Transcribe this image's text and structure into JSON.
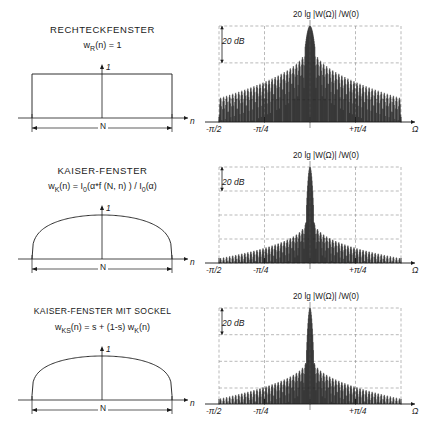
{
  "figure": {
    "background": "#ffffff",
    "ink": "#1a1a1a",
    "grid_color": "#777777"
  },
  "panels": [
    {
      "id": "rechteckfenster",
      "title": "Rechteckfenster",
      "formula_main": "w",
      "formula_sub": "R",
      "formula_rest": "(n)  =  1",
      "time_plot": {
        "y_axis_label": "1",
        "x_axis_label": "n",
        "width_label": "N",
        "shape": "rectangular"
      },
      "spectrum": {
        "label": "20  lg  |W(Ω)| /W(0)",
        "scale_marker": "20 dB",
        "x_axis_label": "Ω",
        "ticks": [
          "-π/2",
          "-π/4",
          "+π/4"
        ],
        "sidelobe_peak_db": -13,
        "sidelobe_decay": "slow",
        "mainlobe_halfwidth": 0.055,
        "floor_db": -52
      }
    },
    {
      "id": "kaiser-fenster",
      "title": "Kaiser-Fenster",
      "formula_main": "w",
      "formula_sub": "K",
      "formula_rest": "(n)  =  I",
      "formula_rest2": "(α*f (N, n) )   /  I",
      "formula_rest3": "(α)",
      "formula_zero": "0",
      "time_plot": {
        "y_axis_label": "1",
        "x_axis_label": "n",
        "width_label": "N",
        "shape": "kaiser"
      },
      "spectrum": {
        "label": "20  lg  |W(Ω)| /W(0)",
        "scale_marker": "20 dB",
        "x_axis_label": "Ω",
        "ticks": [
          "-π/2",
          "-π/4",
          "+π/4"
        ],
        "sidelobe_peak_db": -42,
        "sidelobe_decay": "fast",
        "mainlobe_halfwidth": 0.042,
        "floor_db": -80
      }
    },
    {
      "id": "kaiser-fenster-mit-sockel",
      "title": "Kaiser-Fenster mit Sockel",
      "formula_main": "w",
      "formula_sub": "KS",
      "formula_rest": "(n)  =  s  +   (1-s) w",
      "formula_sub2": "K",
      "formula_rest2": "(n)",
      "time_plot": {
        "y_axis_label": "1",
        "x_axis_label": "n",
        "width_label": "N",
        "shape": "kaiser-pedestal"
      },
      "spectrum": {
        "label": "20  lg  |W(Ω)| /W(0)",
        "scale_marker": "20 dB",
        "x_axis_label": "Ω",
        "ticks": [
          "-π/2",
          "-π/4",
          "+π/4"
        ],
        "sidelobe_peak_db": -38,
        "sidelobe_decay": "medium",
        "mainlobe_halfwidth": 0.04,
        "floor_db": -72
      }
    }
  ],
  "chart_data": {
    "type": "line",
    "charts": [
      {
        "name": "Rechteckfenster - Zeitbereich",
        "type": "line",
        "xlabel": "n",
        "ylabel": "1",
        "x": [
          0,
          0,
          1,
          1
        ],
        "y": [
          0,
          1,
          1,
          0
        ],
        "annotation": "N"
      },
      {
        "name": "Rechteckfenster - Spektrum",
        "type": "line",
        "xlabel": "Ω",
        "ylabel": "20 lg |W(Ω)|/W(0)",
        "xticks": [
          "-π/2",
          "-π/4",
          "0",
          "+π/4"
        ],
        "ygrid_step_db": 20,
        "mainlobe_db": 0,
        "first_sidelobe_db": -13,
        "sidelobe_floor_db": -52
      },
      {
        "name": "Kaiser-Fenster - Zeitbereich",
        "type": "line",
        "xlabel": "n",
        "ylabel": "1",
        "annotation": "N"
      },
      {
        "name": "Kaiser-Fenster - Spektrum",
        "type": "line",
        "xlabel": "Ω",
        "ylabel": "20 lg |W(Ω)|/W(0)",
        "xticks": [
          "-π/2",
          "-π/4",
          "0",
          "+π/4"
        ],
        "ygrid_step_db": 20,
        "mainlobe_db": 0,
        "first_sidelobe_db": -42,
        "sidelobe_floor_db": -80
      },
      {
        "name": "Kaiser-Fenster mit Sockel - Zeitbereich",
        "type": "line",
        "xlabel": "n",
        "ylabel": "1",
        "annotation": "N"
      },
      {
        "name": "Kaiser-Fenster mit Sockel - Spektrum",
        "type": "line",
        "xlabel": "Ω",
        "ylabel": "20 lg |W(Ω)|/W(0)",
        "xticks": [
          "-π/2",
          "-π/4",
          "0",
          "+π/4"
        ],
        "ygrid_step_db": 20,
        "mainlobe_db": 0,
        "first_sidelobe_db": -38,
        "sidelobe_floor_db": -72
      }
    ]
  }
}
